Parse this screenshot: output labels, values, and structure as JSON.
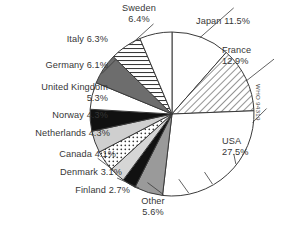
{
  "chart_data": {
    "type": "pie",
    "title": "",
    "xlabel": "",
    "ylabel": "",
    "legend_position": "outside-callout-labels",
    "grid": false,
    "units": "percent",
    "start_angle_deg": 0,
    "direction": "clockwise",
    "categories": [
      "Japan",
      "France",
      "USA",
      "Other",
      "Finland",
      "Denmark",
      "Canada",
      "Netherlands",
      "Norway",
      "United Kingdom",
      "Germany",
      "Italy",
      "Sweden"
    ],
    "values": [
      11.5,
      12.9,
      27.5,
      5.6,
      2.7,
      3.1,
      4.1,
      4.3,
      4.3,
      5.3,
      6.1,
      6.3,
      6.4
    ],
    "slices": [
      {
        "label": "Japan 11.5%",
        "name": "Japan",
        "value": 11.5,
        "fill": "white",
        "fill_color": "#ffffff"
      },
      {
        "label": "France\n12.9%",
        "name": "France",
        "value": 12.9,
        "fill": "diagonal-hatch",
        "fill_color": "#ffffff"
      },
      {
        "label": "USA\n27.5%",
        "name": "USA",
        "value": 27.5,
        "fill": "white",
        "fill_color": "#ffffff"
      },
      {
        "label": "Other\n5.6%",
        "name": "Other",
        "value": 5.6,
        "fill": "solid",
        "fill_color": "#9a9a9a"
      },
      {
        "label": "Finland 2.7%",
        "name": "Finland",
        "value": 2.7,
        "fill": "solid",
        "fill_color": "#111111"
      },
      {
        "label": "Denmark 3.1%",
        "name": "Denmark",
        "value": 3.1,
        "fill": "solid",
        "fill_color": "#d6d6d6"
      },
      {
        "label": "Canada 4.1%",
        "name": "Canada",
        "value": 4.1,
        "fill": "dotted",
        "fill_color": "#ffffff"
      },
      {
        "label": "Netherlands 4.3%",
        "name": "Netherlands",
        "value": 4.3,
        "fill": "solid",
        "fill_color": "#cfcfcf"
      },
      {
        "label": "Norway 4.3%",
        "name": "Norway",
        "value": 4.3,
        "fill": "solid",
        "fill_color": "#111111"
      },
      {
        "label": "United Kingdom\n5.3%",
        "name": "United Kingdom",
        "value": 5.3,
        "fill": "white",
        "fill_color": "#ffffff"
      },
      {
        "label": "Germany 6.1%",
        "name": "Germany",
        "value": 6.1,
        "fill": "solid",
        "fill_color": "#6d6d6d"
      },
      {
        "label": "Italy 6.3%",
        "name": "Italy",
        "value": 6.3,
        "fill": "horizontal-lines",
        "fill_color": "#ffffff"
      },
      {
        "label": "Sweden\n6.4%",
        "name": "Sweden",
        "value": 6.4,
        "fill": "white",
        "fill_color": "#ffffff"
      }
    ]
  },
  "labels": {
    "sweden": "Sweden\n6.4%",
    "japan": "Japan 11.5%",
    "italy": "Italy 6.3%",
    "france": "France\n12.9%",
    "germany": "Germany 6.1%",
    "united_kingdom": "United Kingdom\n5.3%",
    "norway": "Norway 4.3%",
    "usa": "USA\n27.5%",
    "netherlands": "Netherlands 4.3%",
    "canada": "Canada 4.1%",
    "denmark": "Denmark 3.1%",
    "finland": "Finland 2.7%",
    "other": "Other\n5.6%"
  },
  "source_note": "WHO 94319",
  "colors": {
    "outline": "#3a3a3a",
    "text": "#363636",
    "background": "#ffffff"
  }
}
